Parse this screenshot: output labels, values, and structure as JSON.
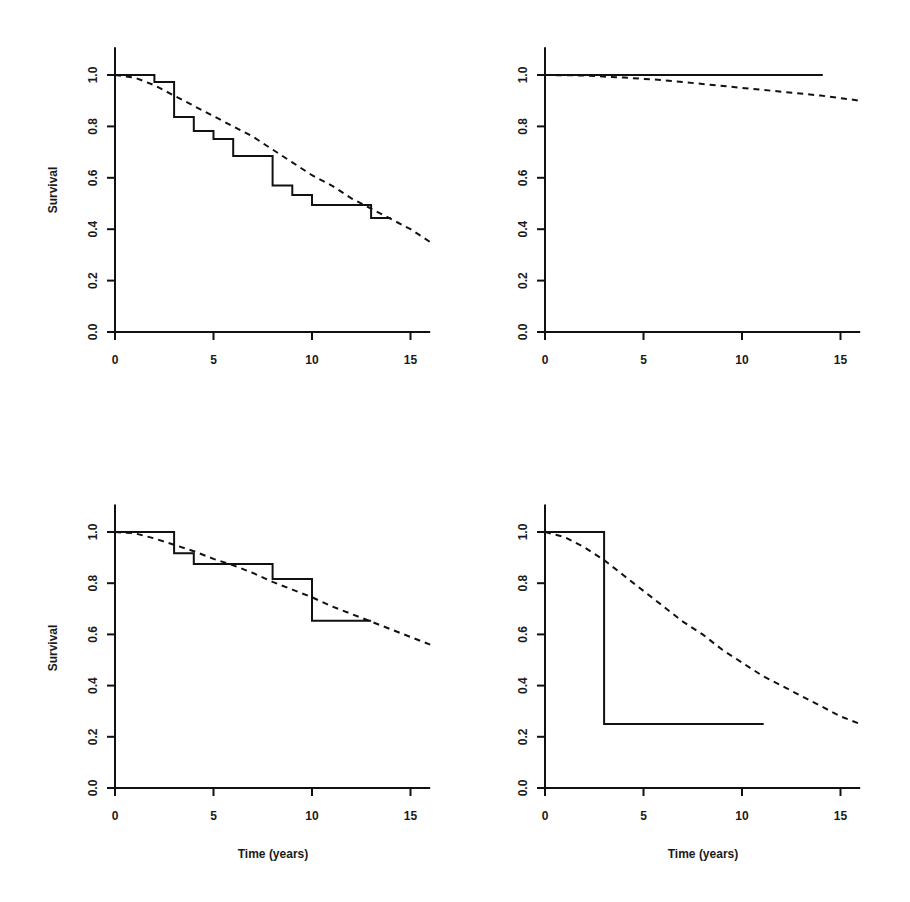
{
  "figure": {
    "ylabel": "Survival",
    "xlabel": "Time (years)",
    "colors": {
      "line": "#111111",
      "background": "#ffffff"
    }
  },
  "chart_data": [
    {
      "type": "line",
      "panel": "top-left",
      "title": "",
      "xlabel": "",
      "ylabel": "Survival",
      "xlim": [
        0,
        16
      ],
      "ylim": [
        0,
        1.1
      ],
      "xticks": [
        0,
        5,
        10,
        15
      ],
      "yticks": [
        "0.0",
        "0.2",
        "0.4",
        "0.6",
        "0.8",
        "1.0"
      ],
      "grid": false,
      "series": [
        {
          "name": "Kaplan-Meier (observed)",
          "style": "solid-step",
          "x": [
            0,
            2,
            3,
            4,
            5,
            6,
            8,
            9,
            10,
            13,
            14
          ],
          "y": [
            1.0,
            0.973,
            0.837,
            0.782,
            0.751,
            0.685,
            0.57,
            0.533,
            0.494,
            0.444,
            0.444
          ]
        },
        {
          "name": "Expected",
          "style": "dashed",
          "x": [
            0,
            1,
            2,
            3,
            4,
            5,
            6,
            7,
            8,
            9,
            10,
            11,
            12,
            13,
            14,
            15,
            16
          ],
          "y": [
            1.0,
            0.99,
            0.96,
            0.92,
            0.88,
            0.84,
            0.8,
            0.76,
            0.71,
            0.66,
            0.61,
            0.57,
            0.52,
            0.48,
            0.44,
            0.4,
            0.35
          ]
        }
      ]
    },
    {
      "type": "line",
      "panel": "top-right",
      "title": "",
      "xlabel": "",
      "ylabel": "",
      "xlim": [
        0,
        16
      ],
      "ylim": [
        0,
        1.1
      ],
      "xticks": [
        0,
        5,
        10,
        15
      ],
      "yticks": [
        "0.0",
        "0.2",
        "0.4",
        "0.6",
        "0.8",
        "1.0"
      ],
      "grid": false,
      "series": [
        {
          "name": "Kaplan-Meier (observed)",
          "style": "solid-step",
          "x": [
            0,
            14.1
          ],
          "y": [
            1.0,
            1.0
          ]
        },
        {
          "name": "Expected",
          "style": "dashed",
          "x": [
            0,
            2,
            4,
            6,
            8,
            10,
            12,
            14,
            16
          ],
          "y": [
            1.0,
            0.998,
            0.99,
            0.98,
            0.965,
            0.95,
            0.935,
            0.92,
            0.9
          ]
        }
      ]
    },
    {
      "type": "line",
      "panel": "bottom-left",
      "title": "",
      "xlabel": "Time (years)",
      "ylabel": "Survival",
      "xlim": [
        0,
        16
      ],
      "ylim": [
        0,
        1.1
      ],
      "xticks": [
        0,
        5,
        10,
        15
      ],
      "yticks": [
        "0.0",
        "0.2",
        "0.4",
        "0.6",
        "0.8",
        "1.0"
      ],
      "grid": false,
      "series": [
        {
          "name": "Kaplan-Meier (observed)",
          "style": "solid-step",
          "x": [
            0,
            3,
            4,
            8,
            10,
            13
          ],
          "y": [
            1.0,
            0.917,
            0.875,
            0.816,
            0.653,
            0.653
          ]
        },
        {
          "name": "Expected",
          "style": "dashed",
          "x": [
            0,
            1,
            2,
            3,
            4,
            5,
            6,
            7,
            8,
            9,
            10,
            11,
            12,
            13,
            14,
            15,
            16
          ],
          "y": [
            1.0,
            0.995,
            0.975,
            0.95,
            0.925,
            0.895,
            0.87,
            0.84,
            0.805,
            0.775,
            0.745,
            0.71,
            0.68,
            0.65,
            0.62,
            0.59,
            0.56
          ]
        }
      ]
    },
    {
      "type": "line",
      "panel": "bottom-right",
      "title": "",
      "xlabel": "Time (years)",
      "ylabel": "",
      "xlim": [
        0,
        16
      ],
      "ylim": [
        0,
        1.1
      ],
      "xticks": [
        0,
        5,
        10,
        15
      ],
      "yticks": [
        "0.0",
        "0.2",
        "0.4",
        "0.6",
        "0.8",
        "1.0"
      ],
      "grid": false,
      "series": [
        {
          "name": "Kaplan-Meier (observed)",
          "style": "solid-step",
          "x": [
            0,
            3,
            11.1
          ],
          "y": [
            1.0,
            0.25,
            0.25
          ]
        },
        {
          "name": "Expected",
          "style": "dashed",
          "x": [
            0,
            1,
            2,
            3,
            4,
            5,
            6,
            7,
            8,
            9,
            10,
            11,
            12,
            13,
            14,
            15,
            16
          ],
          "y": [
            1.0,
            0.98,
            0.94,
            0.89,
            0.83,
            0.77,
            0.71,
            0.65,
            0.6,
            0.54,
            0.49,
            0.44,
            0.4,
            0.36,
            0.32,
            0.28,
            0.25
          ]
        }
      ]
    }
  ]
}
